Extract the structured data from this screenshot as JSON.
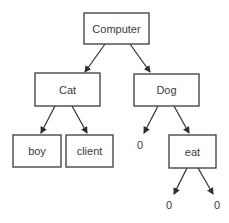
{
  "diagram": {
    "type": "tree",
    "nodes": {
      "computer": {
        "label": "Computer"
      },
      "cat": {
        "label": "Cat"
      },
      "dog": {
        "label": "Dog"
      },
      "boy": {
        "label": "boy"
      },
      "client": {
        "label": "client"
      },
      "eat": {
        "label": "eat"
      },
      "dog_null": {
        "label": "0"
      },
      "eat_null_left": {
        "label": "0"
      },
      "eat_null_right": {
        "label": "0"
      }
    },
    "edges": [
      {
        "from": "Computer",
        "to": "Cat"
      },
      {
        "from": "Computer",
        "to": "Dog"
      },
      {
        "from": "Cat",
        "to": "boy"
      },
      {
        "from": "Cat",
        "to": "client"
      },
      {
        "from": "Dog",
        "to": "0"
      },
      {
        "from": "Dog",
        "to": "eat"
      },
      {
        "from": "eat",
        "to": "0"
      },
      {
        "from": "eat",
        "to": "0"
      }
    ]
  }
}
